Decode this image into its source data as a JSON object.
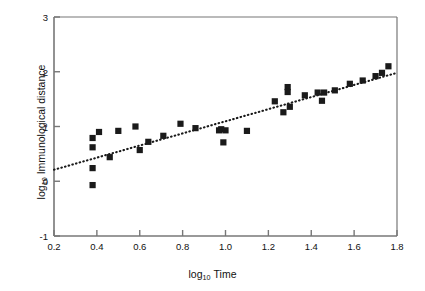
{
  "figure": {
    "title": "",
    "background": "#ffffff",
    "marker_color": "#1a1a1a",
    "axis_color": "#777777",
    "trendline_color": "#1a1a1a"
  },
  "axes": {
    "x_title_main": "log",
    "x_title_sub": "10",
    "x_title_rest": "Time",
    "y_title_main": "log",
    "y_title_sub": "10",
    "y_title_rest": "Immunological distance",
    "x_ticks": [
      "0.2",
      "0.4",
      "0.6",
      "0.8",
      "1.0",
      "1.2",
      "1.4",
      "1.6",
      "1.8"
    ],
    "y_ticks": [
      "3",
      "2",
      "1",
      "0",
      "-1"
    ]
  },
  "chart_data": {
    "type": "scatter",
    "title": "",
    "xlabel": "log10 Time",
    "ylabel": "log10 Immunological distance",
    "xlim": [
      0.2,
      1.8
    ],
    "ylim": [
      -1,
      3
    ],
    "xticks": [
      0.2,
      0.4,
      0.6,
      0.8,
      1.0,
      1.2,
      1.4,
      1.6,
      1.8
    ],
    "yticks": [
      -1,
      0,
      1,
      2,
      3
    ],
    "grid": false,
    "legend": "none",
    "marker": "square",
    "series": [
      {
        "name": "Species pairs",
        "x": [
          0.38,
          0.38,
          0.38,
          0.38,
          0.41,
          0.46,
          0.5,
          0.58,
          0.6,
          0.64,
          0.71,
          0.79,
          0.86,
          0.97,
          0.98,
          0.99,
          1.0,
          1.1,
          1.23,
          1.27,
          1.29,
          1.29,
          1.3,
          1.37,
          1.43,
          1.45,
          1.46,
          1.51,
          1.58,
          1.64,
          1.7,
          1.73,
          1.76
        ],
        "y": [
          0.79,
          0.62,
          0.24,
          -0.07,
          0.9,
          0.44,
          0.92,
          1.0,
          0.57,
          0.72,
          0.83,
          1.05,
          0.97,
          0.93,
          0.95,
          0.71,
          0.93,
          0.92,
          1.46,
          1.26,
          1.72,
          1.63,
          1.36,
          1.57,
          1.62,
          1.47,
          1.62,
          1.66,
          1.78,
          1.84,
          1.92,
          1.98,
          2.1
        ]
      }
    ],
    "trendline": {
      "type": "linear",
      "style": "dotted",
      "x_start": 0.2,
      "y_start": 0.21,
      "x_end": 1.8,
      "y_end": 1.98,
      "slope": 1.106,
      "intercept": -0.011
    }
  }
}
